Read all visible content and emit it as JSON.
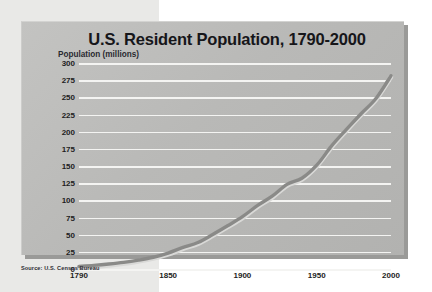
{
  "source_note": "Source: U.S. Census Bureau",
  "chart_data": {
    "type": "line",
    "title": "U.S. Resident Population, 1790-2000",
    "ylabel": "Population (millions)",
    "xlabel": "",
    "grid": "horizontal",
    "legend": "none",
    "xlim": [
      1790,
      2000
    ],
    "ylim": [
      0,
      300
    ],
    "xticks": [
      "1790",
      "1850",
      "1900",
      "1950",
      "2000"
    ],
    "yticks": [
      "0",
      "25",
      "50",
      "75",
      "100",
      "125",
      "150",
      "175",
      "200",
      "225",
      "250",
      "275",
      "300"
    ],
    "series": [
      {
        "name": "U.S. Resident Population",
        "color": "#8a8a88",
        "x": [
          1790,
          1800,
          1810,
          1820,
          1830,
          1840,
          1850,
          1860,
          1870,
          1880,
          1890,
          1900,
          1910,
          1920,
          1930,
          1940,
          1950,
          1960,
          1970,
          1980,
          1990,
          2000
        ],
        "values": [
          3.9,
          5.3,
          7.2,
          9.6,
          12.9,
          17.1,
          23.2,
          31.4,
          38.6,
          50.2,
          62.9,
          76.2,
          92.2,
          106.0,
          123.2,
          132.2,
          151.3,
          179.3,
          203.3,
          226.5,
          248.7,
          281.4
        ]
      }
    ]
  }
}
